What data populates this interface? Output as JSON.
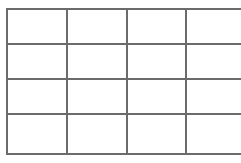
{
  "figure": {
    "kind": "grid-table",
    "title": "",
    "caption": "",
    "background_color": "#ffffff",
    "line_color": "#6b6b6b",
    "line_width_px": 2,
    "rows": 4,
    "columns": 4,
    "bounds": {
      "left_px": 6,
      "top_px": 8,
      "width_px": 228,
      "height_px": 145
    },
    "vertical_rule_positions_px": [
      6,
      64,
      122,
      179,
      234
    ],
    "horizontal_rule_positions_px": [
      8,
      43,
      78,
      113,
      153
    ],
    "column_widths_px": [
      58,
      58,
      57,
      55
    ],
    "row_heights_px": [
      35,
      35,
      35,
      40
    ]
  },
  "table": {
    "has_header": false,
    "headers": [],
    "cells": [
      [
        "",
        "",
        "",
        ""
      ],
      [
        "",
        "",
        "",
        ""
      ],
      [
        "",
        "",
        "",
        ""
      ],
      [
        "",
        "",
        "",
        ""
      ]
    ]
  }
}
